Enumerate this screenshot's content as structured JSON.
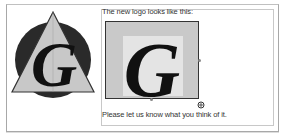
{
  "document": {
    "intro_text": "The new logo looks like this:",
    "closing_text": "Please let us know what you think of it.",
    "logo_letter": "G"
  },
  "image": {
    "selected": true,
    "letter": "G"
  },
  "icons": {
    "logo": "circle-triangle-g-logo",
    "resize_handle": "resize-cursor-icon"
  },
  "colors": {
    "circle": "#2a2a2a",
    "triangle": "#c8c8c8",
    "letter": "#111111",
    "image_bg": "#c9c9c9"
  }
}
